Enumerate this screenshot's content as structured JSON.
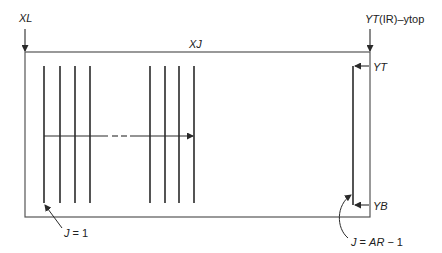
{
  "diagram": {
    "labels": {
      "xl": "XL",
      "xj": "XJ",
      "ytop_prefix": "YT",
      "ytop_suffix": "(IR)–ytop",
      "yt": "YT",
      "yb": "YB",
      "j_first_prefix": "J",
      "j_first_suffix": " = 1",
      "j_last_prefix": "J",
      "j_last_mid": " = ",
      "j_last_ar": "AR",
      "j_last_suffix": " − 1"
    },
    "colors": {
      "line": "#2a2a2a",
      "background": "#ffffff"
    },
    "line_groups": {
      "left_group_count": 4,
      "right_group_count": 4,
      "last_line_count": 1
    }
  }
}
